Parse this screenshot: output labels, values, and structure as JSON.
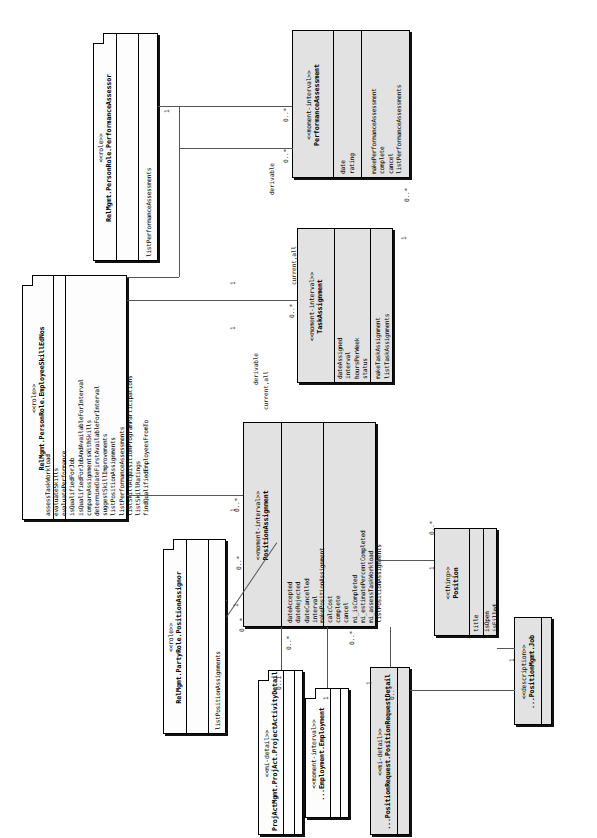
{
  "diagram": {
    "orientation": "rotated-90-ccw",
    "classes": [
      {
        "id": "performance-assessor",
        "stereotype": "<<role>>",
        "name": "RelMgmt.PersonRole.PerformanceAssessor",
        "attributes": [],
        "methods": [
          "listPerformanceAssessments"
        ],
        "shape": "fold"
      },
      {
        "id": "performance-assessment",
        "stereotype": "<<moment-interval>>",
        "name": "PerformanceAssessment",
        "attributes": [
          "date",
          "rating"
        ],
        "methods": [
          "makePerformanceAssessment",
          "complete",
          "cancel",
          "listPerformanceAssessments"
        ],
        "shape": "box"
      },
      {
        "id": "task-assignment",
        "stereotype": "<<moment-interval>>",
        "name": "TaskAssignment",
        "attributes": [
          "dateAssigned",
          "interval",
          "hoursPerWeek",
          "status"
        ],
        "methods": [
          "makeTaskAssignment",
          "listTaskAssignments"
        ],
        "shape": "box"
      },
      {
        "id": "employee-skill-edges",
        "stereotype": "<<role>>",
        "name": "RelMgmt.PersonRole.EmployeeSkillEdNos",
        "attributes": [],
        "methods": [
          "assessTaskWorkload",
          "evaluateSkills",
          "evaluatePerformance",
          "isQualifiedForJob",
          "isQualifiedForJobAndAvailableForInterval",
          "compareAssignmentsWithSkills",
          "determineDateFirstAvailableForInterval",
          "suggestSkillImprovements",
          "listPositionAssignments",
          "listPerformanceAssessments",
          "listSkillAcquisitionProgramParticipations",
          "listSkillRatings",
          "findQualifiedEmployeesFromTo"
        ],
        "shape": "fold"
      },
      {
        "id": "position-assignment",
        "stereotype": "<<moment-interval>>",
        "name": "PositionAssignment",
        "attributes": [
          "dateAccepted",
          "dateRejected",
          "dateCancelled",
          "interval"
        ],
        "methods": [
          "makePositionAssignment",
          "calcCost",
          "complete",
          "cancel",
          "mi_isCompleted",
          "mi_estimatePercentCompleted",
          "mi_assessTaskWorkload",
          "listPositionAssignments"
        ],
        "shape": "box"
      },
      {
        "id": "position-assignor",
        "stereotype": "<<role>>",
        "name": "RelMgmt.PartyRole.PositionAssignor",
        "attributes": [],
        "methods": [
          "listPositionAssignments"
        ],
        "shape": "fold"
      },
      {
        "id": "position",
        "stereotype": "<<thing>>",
        "name": "Position",
        "attributes": [
          "title"
        ],
        "methods": [
          "isOpen",
          "isFilled"
        ],
        "shape": "box"
      },
      {
        "id": "project-activity-detail",
        "stereotype": "<<mi-detail>>",
        "name": "ProjActMgmt.ProjAct.ProjectActivityDetail",
        "attributes": [],
        "methods": [],
        "shape": "fold"
      },
      {
        "id": "employment",
        "stereotype": "<<moment-interval>>",
        "name": "...Employment.Employment",
        "attributes": [],
        "methods": [],
        "shape": "fold"
      },
      {
        "id": "position-request-detail",
        "stereotype": "<<mi-detail>>",
        "name": "...PositionRequest.PositionRequestDetail",
        "attributes": [],
        "methods": [],
        "shape": "box"
      },
      {
        "id": "job",
        "stereotype": "<<description>>",
        "name": "...PositionMgmt.Job",
        "attributes": [],
        "methods": [],
        "shape": "box"
      }
    ],
    "association_labels": [
      {
        "id": "derivable-1",
        "text": "derivable"
      },
      {
        "id": "derivable-2",
        "text": "derivable"
      },
      {
        "id": "current-all-1",
        "text": "current,all"
      },
      {
        "id": "current-all-2",
        "text": "current,all"
      }
    ],
    "multiplicities": [
      {
        "id": "m-assessor-one",
        "text": "1"
      },
      {
        "id": "m-assessment-many-a",
        "text": "0..*"
      },
      {
        "id": "m-assessment-many-b",
        "text": "0..*"
      },
      {
        "id": "m-assessment-many-c",
        "text": "0..*"
      },
      {
        "id": "m-task-many",
        "text": "0..*"
      },
      {
        "id": "m-task-one",
        "text": "1"
      },
      {
        "id": "m-skill-one-a",
        "text": "1"
      },
      {
        "id": "m-skill-one-b",
        "text": "1"
      },
      {
        "id": "m-skill-one-c",
        "text": "1"
      },
      {
        "id": "m-posassign-many-a",
        "text": "0..*"
      },
      {
        "id": "m-posassign-many-b",
        "text": "0..*"
      },
      {
        "id": "m-posassign-many-c",
        "text": "0..*"
      },
      {
        "id": "m-posassign-many-d",
        "text": "0..*"
      },
      {
        "id": "m-posassign-many-e",
        "text": "0..*"
      },
      {
        "id": "m-posassignor-one",
        "text": "1"
      },
      {
        "id": "m-position-one",
        "text": "1"
      },
      {
        "id": "m-position-many",
        "text": "0..*"
      },
      {
        "id": "m-projact-optional",
        "text": "0..1"
      },
      {
        "id": "m-employment-one",
        "text": "1"
      },
      {
        "id": "m-posreqdetail-one",
        "text": "1"
      },
      {
        "id": "m-posreqdetail-many",
        "text": "0..*"
      },
      {
        "id": "m-job-one",
        "text": "1"
      }
    ],
    "colors": {
      "moment_interval_fill": "#e2e2e2",
      "role_fill": "#fdfdfd",
      "line": "#555555",
      "border": "#000000"
    }
  }
}
